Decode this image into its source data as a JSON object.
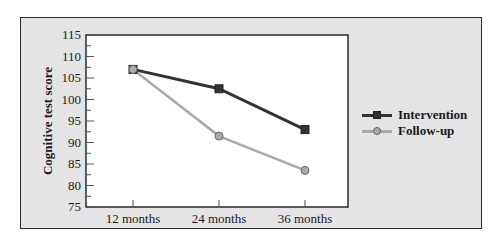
{
  "chart_data": {
    "type": "line",
    "title": "",
    "xlabel": "",
    "ylabel": "Cognitive test score",
    "categories": [
      "12 months",
      "24 months",
      "36 months"
    ],
    "series": [
      {
        "name": "Intervention",
        "values": [
          107,
          102.5,
          93
        ],
        "color": "#333333",
        "marker": "square"
      },
      {
        "name": "Follow-up",
        "values": [
          107,
          91.5,
          83.5
        ],
        "color": "#aaaaaa",
        "marker": "circle"
      }
    ],
    "ylim": [
      75,
      115
    ],
    "yticks": [
      115,
      110,
      105,
      100,
      95,
      90,
      85,
      80,
      75
    ],
    "grid": false,
    "legend_position": "right"
  },
  "axis": {
    "ylabel": "Cognitive test score",
    "yticks": [
      "115",
      "110",
      "105",
      "100",
      "95",
      "90",
      "85",
      "80",
      "75"
    ],
    "xticks": [
      "12 months",
      "24 months",
      "36 months"
    ]
  },
  "legend": {
    "items": [
      {
        "label": "Intervention",
        "color": "#333333"
      },
      {
        "label": "Follow-up",
        "color": "#aaaaaa"
      }
    ]
  }
}
